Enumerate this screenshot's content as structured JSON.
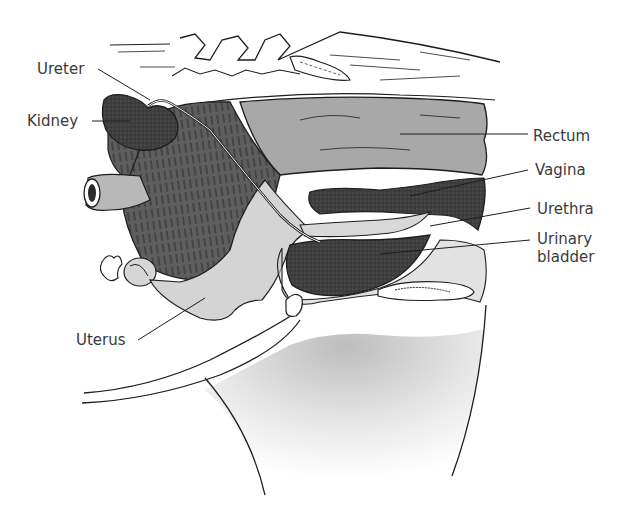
{
  "figure": {
    "type": "anatomical-diagram",
    "colors": {
      "background": "#ffffff",
      "outline": "#1e1e1e",
      "muscle_dark": "#5a5a5a",
      "tissue_mid": "#9a9a9a",
      "tissue_light": "#cfcfcf",
      "organ_dark": "#3c3c3c",
      "label_text": "#3a3a3a"
    }
  },
  "labels": {
    "ureter": "Ureter",
    "kidney": "Kidney",
    "rectum": "Rectum",
    "vagina": "Vagina",
    "urethra": "Urethra",
    "urinary_bladder": "Urinary bladder",
    "uterus": "Uterus"
  }
}
